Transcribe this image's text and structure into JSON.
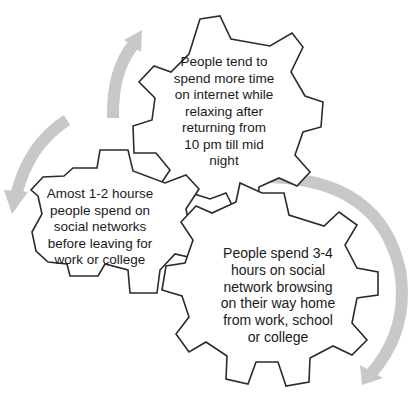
{
  "diagram": {
    "type": "cycle-of-gears",
    "colors": {
      "gear_outline": "#2b2b2b",
      "gear_fill": "#ffffff",
      "arrow": "#c8c8c8",
      "text": "#1a1a1a",
      "background": "#ffffff"
    },
    "gears": [
      {
        "id": "top",
        "text": "People tend to\nspend more time\non internet while\nrelaxing after\nreturning from\n10 pm till mid\nnight"
      },
      {
        "id": "left",
        "text": "Amost 1-2 hourse\npeople spend on\nsocial networks\nbefore leaving for\nwork or college"
      },
      {
        "id": "bottom-right",
        "text": "People spend 3-4\nhours on social\nnetwork browsing\non their way home\nfrom work, school\nor college"
      }
    ],
    "arrows": [
      {
        "id": "arrow-left-to-top",
        "direction": "up"
      },
      {
        "id": "arrow-top-to-left",
        "direction": "down"
      },
      {
        "id": "arrow-right-clockwise",
        "direction": "down"
      }
    ]
  }
}
